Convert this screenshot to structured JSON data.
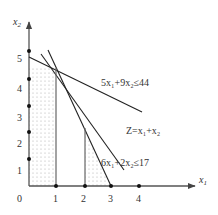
{
  "axes": {
    "x_label": "x",
    "x_label_sub": "1",
    "y_label": "x",
    "y_label_sub": "2",
    "origin_label": "0",
    "x_ticks": [
      "1",
      "2",
      "3",
      "4"
    ],
    "y_ticks": [
      "1",
      "2",
      "3",
      "4",
      "5"
    ]
  },
  "constraints": [
    {
      "label": "5x₁+9x₂≤44"
    },
    {
      "label": "Z=x₁+x₂"
    },
    {
      "label": "6x₁+2x₂≤17"
    }
  ],
  "colors": {
    "line": "#222222",
    "axis": "#555555",
    "shade_dot": "#9a9a9a",
    "text": "#333333"
  }
}
